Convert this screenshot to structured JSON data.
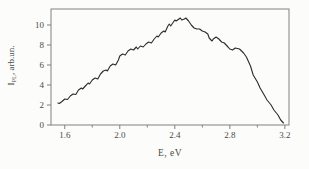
{
  "figure": {
    "background": "#fcfcfa",
    "frame_color": "#818181",
    "line_color": "#2b2b2b",
    "text_color": "#4a4a4a"
  },
  "chart_data": {
    "type": "line",
    "title": "",
    "xlabel": "E, eV",
    "ylabel": "I_PL, arb.un.",
    "ylabel_parts": {
      "main": "I",
      "sub": "PL",
      "rest": ", arb.un."
    },
    "xlim": [
      1.5,
      3.23
    ],
    "ylim": [
      0,
      11.6
    ],
    "xticks_major": [
      1.6,
      2.0,
      2.4,
      2.8,
      3.2
    ],
    "xtick_labels": [
      "1.6",
      "2.0",
      "2.4",
      "2.8",
      "3.2"
    ],
    "xticks_minor": [
      1.8,
      2.2,
      2.6,
      3.0
    ],
    "yticks": [
      0,
      2,
      4,
      6,
      8,
      10
    ],
    "ytick_labels": [
      "0",
      "2",
      "4",
      "6",
      "8",
      "10"
    ],
    "grid": false,
    "legend_position": "none",
    "series": [
      {
        "name": "PL spectrum",
        "x": [
          1.55,
          1.56,
          1.58,
          1.6,
          1.62,
          1.64,
          1.66,
          1.68,
          1.7,
          1.72,
          1.73,
          1.75,
          1.77,
          1.78,
          1.8,
          1.82,
          1.84,
          1.86,
          1.88,
          1.9,
          1.91,
          1.93,
          1.95,
          1.97,
          1.99,
          2.0,
          2.02,
          2.04,
          2.06,
          2.08,
          2.1,
          2.12,
          2.13,
          2.15,
          2.17,
          2.19,
          2.21,
          2.23,
          2.25,
          2.27,
          2.28,
          2.3,
          2.32,
          2.33,
          2.35,
          2.36,
          2.37,
          2.39,
          2.4,
          2.41,
          2.43,
          2.44,
          2.45,
          2.47,
          2.48,
          2.5,
          2.52,
          2.54,
          2.56,
          2.58,
          2.6,
          2.62,
          2.64,
          2.65,
          2.67,
          2.68,
          2.7,
          2.72,
          2.74,
          2.76,
          2.78,
          2.8,
          2.82,
          2.84,
          2.87,
          2.9,
          2.92,
          2.95,
          2.97,
          3.0,
          3.02,
          3.05,
          3.07,
          3.1,
          3.12,
          3.15,
          3.17,
          3.19
        ],
        "y": [
          2.2,
          2.15,
          2.35,
          2.6,
          2.55,
          2.9,
          3.1,
          3.05,
          3.5,
          3.7,
          3.6,
          3.9,
          4.2,
          4.1,
          4.5,
          4.7,
          4.6,
          5.1,
          5.4,
          5.5,
          5.4,
          5.9,
          6.1,
          6.0,
          6.5,
          6.9,
          7.1,
          7.0,
          7.4,
          7.6,
          7.5,
          7.8,
          7.6,
          7.9,
          7.8,
          8.1,
          8.3,
          8.2,
          8.6,
          8.9,
          8.8,
          9.2,
          9.4,
          9.3,
          9.9,
          10.1,
          9.9,
          10.3,
          10.5,
          10.4,
          10.6,
          10.7,
          10.5,
          10.6,
          10.7,
          10.4,
          10.0,
          9.7,
          9.6,
          9.6,
          9.4,
          9.3,
          9.1,
          8.7,
          8.4,
          8.6,
          8.8,
          8.6,
          8.3,
          8.2,
          7.9,
          7.6,
          7.5,
          7.7,
          7.6,
          7.2,
          6.8,
          5.9,
          5.0,
          4.3,
          3.7,
          3.0,
          2.5,
          2.0,
          1.5,
          1.0,
          0.5,
          0.2
        ]
      }
    ]
  }
}
